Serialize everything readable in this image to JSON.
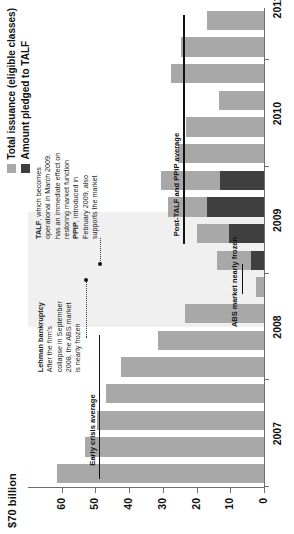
{
  "chart_data": {
    "type": "bar",
    "title": "$70 billion",
    "subtitle": "",
    "xlabel": "",
    "ylabel": "$70 billion",
    "ylim": [
      0,
      70
    ],
    "yticks": [
      0,
      10,
      20,
      30,
      40,
      50,
      60
    ],
    "ytick_labels": [
      "0",
      "10",
      "20",
      "30",
      "40",
      "50",
      "60"
    ],
    "grid": false,
    "legend_position": "top-right",
    "stacked": false,
    "categories": [
      "2007Q1",
      "2007Q2",
      "2007Q3",
      "2007Q4",
      "2008Q1",
      "2008Q2",
      "2008Q3",
      "2008Q4",
      "2009Q1",
      "2009Q2",
      "2009Q3",
      "2009Q4",
      "2010Q1",
      "2010Q2",
      "2010Q3",
      "2010Q4",
      "2011Q1",
      "2011Q2"
    ],
    "xtick_labels": [
      "2007",
      "2008",
      "2009",
      "2010",
      "2011"
    ],
    "series": [
      {
        "name": "Total issuance (eligible classes)",
        "color": "#a8a8a8",
        "values": [
          61.5,
          53.0,
          49.5,
          47.0,
          42.5,
          31.5,
          23.5,
          2.5,
          14.0,
          20.0,
          28.5,
          30.5,
          25.5,
          23.0,
          13.5,
          27.5,
          24.5,
          17.0
        ]
      },
      {
        "name": "Amount pledged to TALF",
        "color": "#3f3f3f",
        "values": [
          0,
          0,
          0,
          0,
          0,
          0,
          0,
          0,
          4.0,
          10.5,
          17.0,
          13.0,
          0,
          0,
          0,
          0,
          0,
          0
        ]
      }
    ],
    "annotations": [
      {
        "id": "lehman",
        "title": "Lehman bankruptcy",
        "body": "After the firm's collapse in September 2008, the ABS market is nearly frozen",
        "points_to": "2008Q4"
      },
      {
        "id": "talf-ppip",
        "title_1": "TALF",
        "body_1": ", which becomes operational in March 2009, has an immediate effect on restoring market function",
        "title_2": "PPIP",
        "body_2": ", introduced in February 2009, also supports the market",
        "points_to": "2009Q1"
      },
      {
        "id": "early-crisis-average",
        "label": "Early crisis average",
        "value": 49
      },
      {
        "id": "post-talf-ppip-average",
        "label": "Post-TALF and PPIP average",
        "value": 24
      },
      {
        "id": "abs-market-nearly-frozen",
        "label": "ABS market nearly frozen"
      }
    ]
  },
  "legend": {
    "items": [
      {
        "label": "Total issuance (eligible classes)",
        "color": "#a8a8a8"
      },
      {
        "label": "Amount pledged to TALF",
        "color": "#3f3f3f"
      }
    ]
  },
  "axis": {
    "title": "$70 billion",
    "ticks": [
      "60",
      "50",
      "40",
      "30",
      "20",
      "10",
      "0"
    ],
    "years": [
      "2007",
      "2008",
      "2009",
      "2010",
      "2011"
    ]
  },
  "callouts": {
    "lehman_title": "Lehman bankruptcy",
    "lehman_body": "After the firm's collapse in September 2008, the ABS market is nearly frozen",
    "talf_bold": "TALF",
    "talf_body": ", which becomes operational in March 2009, has an immediate effect on restoring market function",
    "ppip_bold": "PPIP",
    "ppip_body": ", introduced in February 2009, also supports the market",
    "early_crisis_average": "Early crisis average",
    "post_talf_average": "Post-TALF and PPIP average",
    "frozen": "ABS market nearly frozen"
  }
}
